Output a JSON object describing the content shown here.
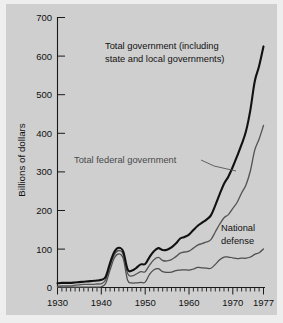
{
  "figure": {
    "background_color": "#cfcfcf",
    "page_color": "#eeeeee"
  },
  "axes": {
    "ytitle": "Billions of dollars",
    "yticks": [
      "0",
      "100",
      "200",
      "300",
      "400",
      "500",
      "600",
      "700"
    ],
    "xticks": [
      "1930",
      "1940",
      "1950",
      "1960",
      "1970",
      "1977"
    ]
  },
  "annotations": {
    "total_gov_line1": "Total government (including",
    "total_gov_line2": "state and local governments)",
    "total_federal": "Total federal government",
    "defense_line1": "National",
    "defense_line2": "defense"
  },
  "chart_data": {
    "type": "line",
    "title": "",
    "xlabel": "",
    "ylabel": "Billions of dollars",
    "xlim": [
      1930,
      1977
    ],
    "ylim": [
      0,
      700
    ],
    "xticks": [
      1930,
      1940,
      1950,
      1960,
      1970,
      1977
    ],
    "yticks": [
      0,
      100,
      200,
      300,
      400,
      500,
      600,
      700
    ],
    "minor_x_tick_step": 1,
    "grid": false,
    "legend": "inline-annotations",
    "x": [
      1930,
      1931,
      1932,
      1933,
      1934,
      1935,
      1936,
      1937,
      1938,
      1939,
      1940,
      1941,
      1942,
      1943,
      1944,
      1945,
      1946,
      1947,
      1948,
      1949,
      1950,
      1951,
      1952,
      1953,
      1954,
      1955,
      1956,
      1957,
      1958,
      1959,
      1960,
      1961,
      1962,
      1963,
      1964,
      1965,
      1966,
      1967,
      1968,
      1969,
      1970,
      1971,
      1972,
      1973,
      1974,
      1975,
      1976,
      1977
    ],
    "series": [
      {
        "name": "Total government (including state and local governments)",
        "color": "#111111",
        "line_width": "thick",
        "values": [
          11,
          12,
          12,
          12,
          13,
          14,
          15,
          16,
          17,
          18,
          20,
          28,
          64,
          93,
          103,
          93,
          47,
          44,
          51,
          60,
          61,
          79,
          94,
          102,
          97,
          98,
          104,
          114,
          127,
          131,
          137,
          149,
          160,
          168,
          176,
          187,
          213,
          242,
          269,
          288,
          313,
          341,
          371,
          405,
          460,
          534,
          574,
          625
        ]
      },
      {
        "name": "Total federal government",
        "color": "#555555",
        "line_width": "medium",
        "values": [
          3,
          4,
          4,
          4,
          6,
          7,
          8,
          8,
          8,
          9,
          10,
          20,
          56,
          86,
          96,
          85,
          36,
          30,
          35,
          41,
          41,
          58,
          72,
          78,
          70,
          69,
          72,
          80,
          89,
          92,
          94,
          102,
          110,
          114,
          118,
          124,
          144,
          164,
          181,
          189,
          205,
          221,
          245,
          266,
          302,
          356,
          385,
          420
        ]
      },
      {
        "name": "National defense",
        "color": "#4d4d4d",
        "line_width": "medium",
        "values": [
          1,
          1,
          1,
          1,
          1,
          1,
          1,
          1,
          1,
          1,
          2,
          11,
          46,
          77,
          87,
          75,
          19,
          12,
          12,
          13,
          14,
          34,
          46,
          49,
          41,
          39,
          40,
          44,
          45,
          46,
          45,
          48,
          52,
          51,
          50,
          50,
          60,
          72,
          79,
          79,
          77,
          75,
          76,
          76,
          79,
          86,
          90,
          100
        ]
      }
    ]
  }
}
